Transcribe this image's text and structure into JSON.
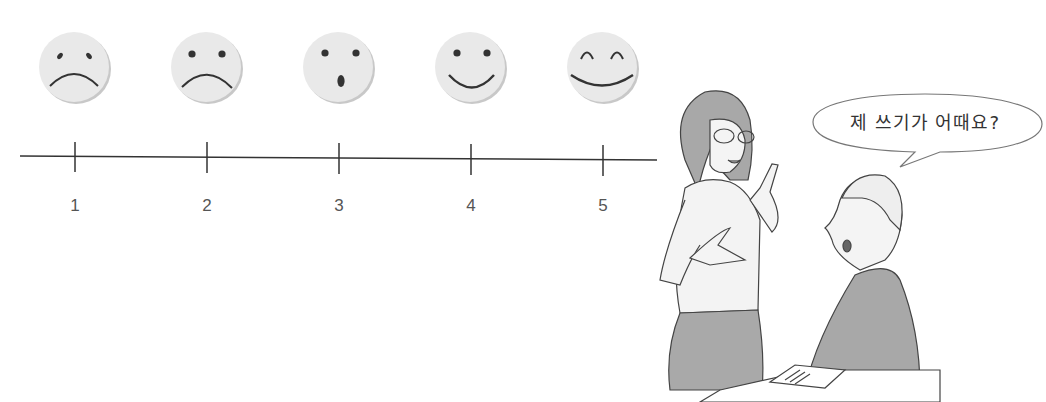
{
  "scale": {
    "points": [
      {
        "value": "1",
        "face": "very-sad",
        "x": 75
      },
      {
        "value": "2",
        "face": "sad",
        "x": 207
      },
      {
        "value": "3",
        "face": "surprised",
        "x": 339
      },
      {
        "value": "4",
        "face": "happy",
        "x": 471
      },
      {
        "value": "5",
        "face": "very-happy",
        "x": 603
      }
    ],
    "line_color": "#333333",
    "face_fill": "#e8e8e8"
  },
  "illustration": {
    "speech_bubble": "제 쓰기가 어때요?",
    "characters": [
      "teacher-woman",
      "student-man"
    ]
  }
}
